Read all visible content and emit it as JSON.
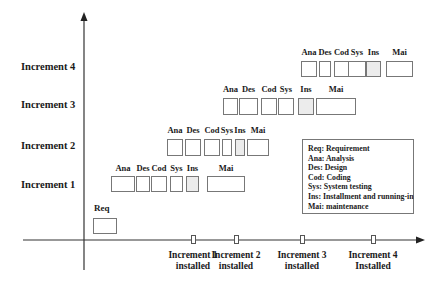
{
  "rows": [
    {
      "label": "Increment 4",
      "y": 68
    },
    {
      "label": "Increment 3",
      "y": 106
    },
    {
      "label": "Increment 2",
      "y": 147
    },
    {
      "label": "Increment 1",
      "y": 186
    }
  ],
  "phase_abbrev": {
    "ana": "Ana",
    "des": "Des",
    "cod": "Cod",
    "sys": "Sys",
    "ins": "Ins",
    "mai": "Mai",
    "req": "Req"
  },
  "increments": [
    {
      "name": "Increment 1",
      "label_y": 163,
      "box_top": 176,
      "box_h": 16,
      "boxes": [
        {
          "phase": "Ana",
          "x": 111,
          "w": 24
        },
        {
          "phase": "Des",
          "x": 136,
          "w": 14
        },
        {
          "phase": "Cod",
          "x": 151,
          "w": 16
        },
        {
          "phase": "Sys",
          "x": 170,
          "w": 13
        },
        {
          "phase": "Ins",
          "x": 186,
          "w": 13
        },
        {
          "phase": "Mai",
          "x": 207,
          "w": 38
        }
      ]
    },
    {
      "name": "Increment 2",
      "label_y": 125,
      "box_top": 139,
      "box_h": 17,
      "boxes": [
        {
          "phase": "Ana",
          "x": 167,
          "w": 16
        },
        {
          "phase": "Des",
          "x": 185,
          "w": 16
        },
        {
          "phase": "Cod",
          "x": 204,
          "w": 16
        },
        {
          "phase": "Sys",
          "x": 222,
          "w": 10
        },
        {
          "phase": "Ins",
          "x": 235,
          "w": 10
        },
        {
          "phase": "Mai",
          "x": 247,
          "w": 22
        }
      ]
    },
    {
      "name": "Increment 3",
      "label_y": 84,
      "box_top": 98,
      "box_h": 17,
      "boxes": [
        {
          "phase": "Ana",
          "x": 223,
          "w": 15
        },
        {
          "phase": "Des",
          "x": 239,
          "w": 19
        },
        {
          "phase": "Cod",
          "x": 261,
          "w": 16
        },
        {
          "phase": "Sys",
          "x": 278,
          "w": 16
        },
        {
          "phase": "Ins",
          "x": 298,
          "w": 16
        },
        {
          "phase": "Mai",
          "x": 316,
          "w": 40
        }
      ]
    },
    {
      "name": "Increment 4",
      "label_y": 47,
      "box_top": 61,
      "box_h": 16,
      "boxes": [
        {
          "phase": "Ana",
          "x": 301,
          "w": 16
        },
        {
          "phase": "Des",
          "x": 319,
          "w": 12
        },
        {
          "phase": "Cod",
          "x": 334,
          "w": 15
        },
        {
          "phase": "Sys",
          "x": 348,
          "w": 18
        },
        {
          "phase": "Ins",
          "x": 366,
          "w": 15
        },
        {
          "phase": "Mai",
          "x": 386,
          "w": 27
        }
      ]
    }
  ],
  "requirement": {
    "label": "Req",
    "x": 93,
    "y": 218,
    "w": 24,
    "h": 16
  },
  "milestones": [
    {
      "line1": "Increment 1",
      "line2": "installed",
      "x": 193
    },
    {
      "line1": "Increment 2",
      "line2": "installed",
      "x": 236
    },
    {
      "line1": "Increment 3",
      "line2": "installed",
      "x": 302
    },
    {
      "line1": "Increment 4",
      "line2": "Installed",
      "x": 373
    }
  ],
  "legend": [
    "Req: Requirement",
    "Ana: Analysis",
    "Des: Design",
    "Cod: Coding",
    "Sys: System testing",
    "Ins: Installment and running-in",
    "Mai: maintenance"
  ],
  "colors": {
    "axis": "#333333",
    "box_border": "#777777",
    "ins_fill": "#ececec"
  }
}
